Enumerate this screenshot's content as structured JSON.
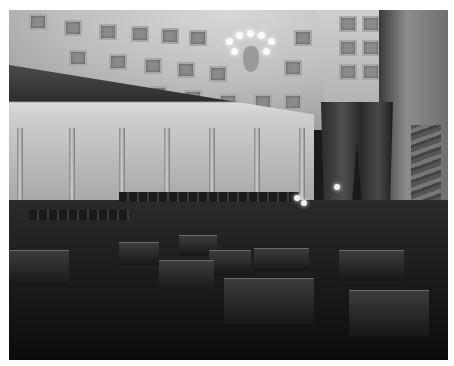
{
  "image": {
    "subject": "Historic legislative chamber interior",
    "style": "black-and-white photograph",
    "features": [
      "coffered half-dome ceiling",
      "crystal chandelier",
      "curved gallery balcony with draped bunting",
      "colonnade",
      "rows of wooden desks and chairs",
      "canopied presiding officer's dais",
      "marble columns",
      "patterned carpet"
    ]
  }
}
